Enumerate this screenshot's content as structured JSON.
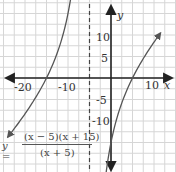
{
  "chart_data": {
    "type": "line",
    "title": "",
    "equation": {
      "lhs": "y =",
      "numerator": "(x − 5)(x + 15)",
      "denominator": "(x + 5)"
    },
    "xlabel": "x",
    "ylabel": "y",
    "xlim": [
      -25,
      15
    ],
    "ylim": [
      -22,
      18
    ],
    "grid": true,
    "grid_step": 2.5,
    "x_tick_labels": [
      "-20",
      "-10",
      "10"
    ],
    "y_tick_labels": [
      "10",
      "5",
      "-5",
      "-10"
    ],
    "vertical_asymptote": {
      "x": -5,
      "style": "dashed"
    },
    "series": [
      {
        "name": "left branch",
        "x": [
          -24,
          -22,
          -20,
          -18,
          -16,
          -15,
          -14,
          -12,
          -10,
          -8,
          -7
        ],
        "y": [
          -13.0,
          -8.6,
          -5.0,
          -1.8,
          1.9,
          0.0,
          2.1,
          4.9,
          9.0,
          17.3,
          20.0
        ]
      },
      {
        "name": "right branch",
        "x": [
          -1,
          0,
          2,
          4,
          5,
          6,
          8,
          10,
          11.5
        ],
        "y": [
          -21.0,
          -15.0,
          -7.6,
          -2.1,
          0.0,
          1.9,
          5.2,
          8.3,
          10.6
        ]
      }
    ],
    "x_intercepts": [
      -15,
      5
    ],
    "y_intercept": -15
  },
  "labels": {
    "x_axis": "x",
    "y_axis": "y",
    "x_ticks": [
      {
        "text": "-20",
        "value": -20
      },
      {
        "text": "-10",
        "value": -10
      },
      {
        "text": "10",
        "value": 10
      }
    ],
    "y_ticks": [
      {
        "text": "10",
        "value": 10
      },
      {
        "text": "5",
        "value": 5
      },
      {
        "text": "-5",
        "value": -5
      },
      {
        "text": "-10",
        "value": -10
      }
    ]
  },
  "colors": {
    "axis": "#222222",
    "curve": "#555555",
    "grid": "#d6d6d6",
    "asymptote": "#444444"
  }
}
